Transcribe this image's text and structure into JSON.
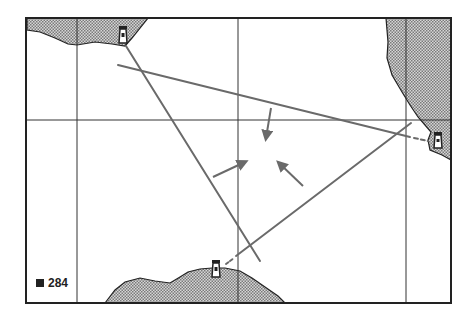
{
  "figure": {
    "number_label": "284",
    "bullet": "square"
  },
  "colors": {
    "frame": "#222222",
    "grid": "#333333",
    "land_fill": "#bdbdbd",
    "bearing_lines": "#6a6a6a",
    "arrows": "#6a6a6a"
  },
  "map": {
    "frame": {
      "x": 26,
      "y": 18,
      "width": 425,
      "height": 285
    },
    "grid_vertical_x": [
      77,
      238,
      406
    ],
    "grid_horizontal_y": [
      120
    ],
    "lighthouses": [
      {
        "name": "lighthouse-north",
        "x": 123,
        "y": 37
      },
      {
        "name": "lighthouse-east",
        "x": 437,
        "y": 142
      },
      {
        "name": "lighthouse-south",
        "x": 216,
        "y": 270
      }
    ],
    "bearing_lines": [
      {
        "name": "bearing-north",
        "x1": 126,
        "y1": 46,
        "x2": 260,
        "y2": 261
      },
      {
        "name": "bearing-east",
        "x1": 118,
        "y1": 65,
        "x2": 428,
        "y2": 141
      },
      {
        "name": "bearing-south",
        "x1": 228,
        "y1": 262,
        "x2": 411,
        "y2": 123
      }
    ],
    "arrows": [
      {
        "name": "arrow-down",
        "x1": 271,
        "y1": 108,
        "x2": 265,
        "y2": 143
      },
      {
        "name": "arrow-right-up",
        "x1": 213,
        "y1": 177,
        "x2": 250,
        "y2": 160
      },
      {
        "name": "arrow-left-up",
        "x1": 303,
        "y1": 186,
        "x2": 275,
        "y2": 160
      }
    ]
  }
}
